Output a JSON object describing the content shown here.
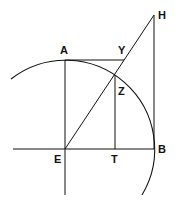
{
  "diagram": {
    "type": "geometric-construction",
    "stroke_color": "#111111",
    "background": "#ffffff",
    "points": {
      "A": {
        "label": "A",
        "x": 65,
        "y": 60
      },
      "Y": {
        "label": "Y",
        "x": 124,
        "y": 60
      },
      "H": {
        "label": "H",
        "x": 154,
        "y": 15
      },
      "Z": {
        "label": "Z",
        "x": 115,
        "y": 75
      },
      "E": {
        "label": "E",
        "x": 65,
        "y": 149
      },
      "T": {
        "label": "T",
        "x": 115,
        "y": 149
      },
      "B": {
        "label": "B",
        "x": 154,
        "y": 149
      }
    },
    "circle": {
      "center": "E",
      "radius": 89
    },
    "segments": [
      [
        "A",
        "Y"
      ],
      [
        "E",
        "H"
      ],
      [
        "H",
        "B"
      ],
      [
        "Z",
        "T"
      ],
      [
        "A",
        "E"
      ]
    ],
    "labels": {
      "A": "A",
      "Y": "Y",
      "H": "H",
      "Z": "Z",
      "E": "E",
      "T": "T",
      "B": "B"
    }
  }
}
